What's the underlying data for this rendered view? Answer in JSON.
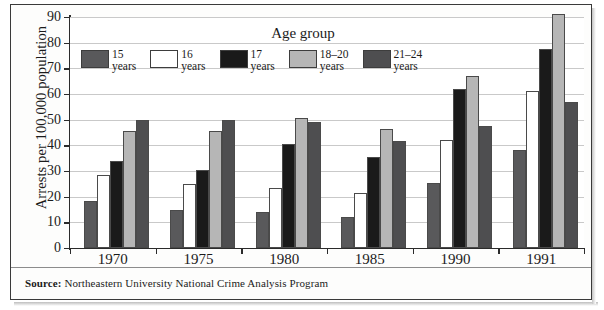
{
  "figure": {
    "ylabel": "Arrests per 100,000 population",
    "legend_title": "Age group",
    "source_label": "Source:",
    "source_text": "Northeastern University National Crime Analysis Program"
  },
  "chart_data": {
    "type": "bar",
    "title": "",
    "xlabel": "",
    "ylabel": "Arrests per 100,000 population",
    "ylim": [
      0,
      90
    ],
    "ytick_step": 10,
    "yticks": [
      0,
      10,
      20,
      30,
      40,
      50,
      60,
      70,
      80,
      90
    ],
    "grid": true,
    "legend_position": "top-center",
    "legend_title": "Age group",
    "categories": [
      "1970",
      "1975",
      "1980",
      "1985",
      "1990",
      "1991"
    ],
    "series": [
      {
        "name": "15 years",
        "label_line1": "15",
        "label_line2": "years",
        "color": "#59595b",
        "values": [
          18.5,
          15.0,
          14.0,
          12.0,
          25.5,
          38.0
        ]
      },
      {
        "name": "16 years",
        "label_line1": "16",
        "label_line2": "years",
        "color": "#ffffff",
        "values": [
          28.5,
          25.0,
          23.5,
          21.5,
          42.0,
          61.0
        ]
      },
      {
        "name": "17 years",
        "label_line1": "17",
        "label_line2": "years",
        "color": "#1a1a1a",
        "values": [
          34.0,
          30.5,
          40.5,
          35.5,
          62.0,
          77.5
        ]
      },
      {
        "name": "18–20 years",
        "label_line1": "18–20",
        "label_line2": "years",
        "color": "#b6b6b6",
        "values": [
          45.5,
          45.5,
          50.5,
          46.5,
          67.0,
          91.0
        ]
      },
      {
        "name": "21–24 years",
        "label_line1": "21–24",
        "label_line2": "years",
        "color": "#4e4e50",
        "values": [
          50.0,
          50.0,
          49.0,
          41.5,
          47.5,
          57.0
        ]
      }
    ]
  }
}
